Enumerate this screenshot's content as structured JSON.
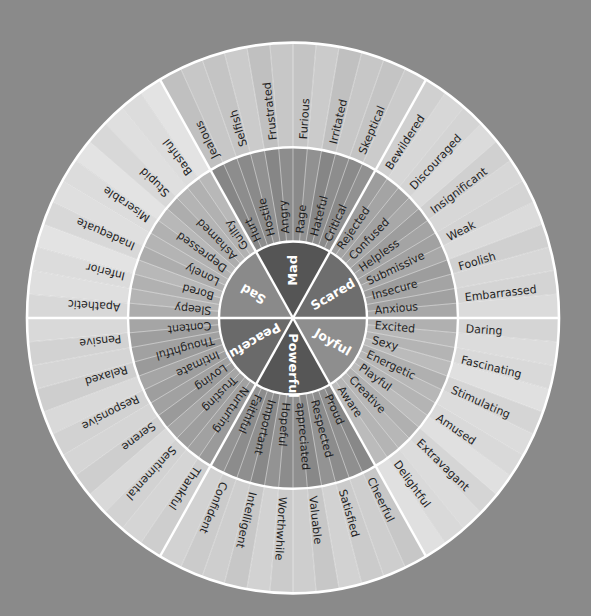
{
  "colors": {
    "background": "#8a8a8a",
    "divider": "#ffffff",
    "text_dark": "#1f1f1f",
    "text_light": "#ffffff"
  },
  "wheel": {
    "sectors": [
      {
        "core": "Scared",
        "core_color": "#6e6e6e",
        "middle_color": "#a3a3a3",
        "outer_color": "#d6d6d6",
        "middle": [
          "Anxious",
          "Insecure",
          "Submissive",
          "Helpless",
          "Confused",
          "Rejected"
        ],
        "outer": [
          "Embarrassed",
          "Foolish",
          "Weak",
          "Insignificant",
          "Discouraged",
          "Bewildered"
        ]
      },
      {
        "core": "Mad",
        "core_color": "#555555",
        "middle_color": "#8c8c8c",
        "outer_color": "#c6c6c6",
        "middle": [
          "Critical",
          "Hateful",
          "Rage",
          "Angry",
          "Hostile",
          "Hurt"
        ],
        "outer": [
          "Skeptical",
          "Irritated",
          "Furious",
          "Frustrated",
          "Selfish",
          "Jealous"
        ]
      },
      {
        "core": "Sad",
        "core_color": "#8a8a8a",
        "middle_color": "#b3b3b3",
        "outer_color": "#dedede",
        "middle": [
          "Guilty",
          "Ashamed",
          "Depressed",
          "Lonely",
          "Bored",
          "Sleepy"
        ],
        "outer": [
          "Bashful",
          "Stupid",
          "Miserable",
          "Inadequate",
          "Inferior",
          "Apathetic"
        ]
      },
      {
        "core": "Peaceful",
        "core_color": "#6a6a6a",
        "middle_color": "#a0a0a0",
        "outer_color": "#d4d4d4",
        "middle": [
          "Content",
          "Thoughtful",
          "Intimate",
          "Loving",
          "Trusting",
          "Nurturing"
        ],
        "outer": [
          "Pensive",
          "Relaxed",
          "Responsive",
          "Serene",
          "Sentimental",
          "Thankful"
        ]
      },
      {
        "core": "Powerful",
        "core_color": "#565656",
        "middle_color": "#8e8e8e",
        "outer_color": "#cdcdcd",
        "middle": [
          "Faithful",
          "Important",
          "Hopeful",
          "appreciated",
          "Respected",
          "Proud"
        ],
        "outer": [
          "Confident",
          "Intelligent",
          "Worthwhile",
          "Valuable",
          "Satisfied",
          "Cheerful"
        ]
      },
      {
        "core": "Joyful",
        "core_color": "#8e8e8e",
        "middle_color": "#b6b6b6",
        "outer_color": "#dbdbdb",
        "middle": [
          "Aware",
          "Creative",
          "Playful",
          "Energetic",
          "Sexy",
          "Excited"
        ],
        "outer": [
          "Delightful",
          "Extravagant",
          "Amused",
          "Stimulating",
          "Fascinating",
          "Daring"
        ]
      }
    ]
  }
}
